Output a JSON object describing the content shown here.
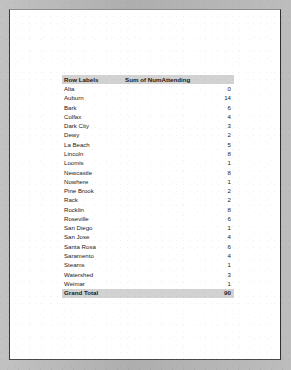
{
  "document": {
    "type": "scanned-page",
    "background_color": "#b9b9b9",
    "paper_color": "#ffffff"
  },
  "table": {
    "name": "pivot-table",
    "header_fill": "#d2d2d2",
    "columns": [
      {
        "key": "label",
        "header": "Row Labels",
        "align": "left"
      },
      {
        "key": "value",
        "header": "Sum of NumAttending",
        "align": "right"
      }
    ],
    "rows": [
      {
        "label": "Alta",
        "value": "0"
      },
      {
        "label": "Auburn",
        "value": "14"
      },
      {
        "label": "Bark",
        "value": "6"
      },
      {
        "label": "Colfax",
        "value": "4"
      },
      {
        "label": "Dark City",
        "value": "3"
      },
      {
        "label": "Dewy",
        "value": "2"
      },
      {
        "label": "La Beach",
        "value": "5"
      },
      {
        "label": "Lincoln",
        "value": "8"
      },
      {
        "label": "Loomis",
        "value": "1"
      },
      {
        "label": "Newcastle",
        "value": "8"
      },
      {
        "label": "Nowhere",
        "value": "1"
      },
      {
        "label": "Pine Brook",
        "value": "2"
      },
      {
        "label": "Rack",
        "value": "2"
      },
      {
        "label": "Rocklin",
        "value": "8"
      },
      {
        "label": "Roseville",
        "value": "6"
      },
      {
        "label": "San Diego",
        "value": "1"
      },
      {
        "label": "San Jose",
        "value": "4"
      },
      {
        "label": "Santa Rosa",
        "value": "6"
      },
      {
        "label": "Saramento",
        "value": "4"
      },
      {
        "label": "Steams",
        "value": "1"
      },
      {
        "label": "Watershed",
        "value": "3"
      },
      {
        "label": "Weimar",
        "value": "1"
      }
    ],
    "total": {
      "label": "Grand Total",
      "value": "90"
    }
  }
}
